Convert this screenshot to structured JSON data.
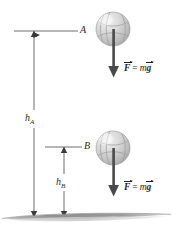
{
  "figure": {
    "background_color": "#ffffff",
    "ink_color": "#2b2b2b",
    "ball_color": "#c9c9c9",
    "ground_color": "#9a9a9a"
  },
  "points": [
    {
      "id": "A",
      "label": "A",
      "x": 82,
      "y": 31
    },
    {
      "id": "B",
      "label": "B",
      "x": 86,
      "y": 147
    }
  ],
  "heights": [
    {
      "id": "hA",
      "symbol": "h",
      "subscript": "A",
      "label": "h_A",
      "x": 27,
      "y": 118
    },
    {
      "id": "hB",
      "symbol": "h",
      "subscript": "B",
      "label": "h_B",
      "x": 57,
      "y": 182
    }
  ],
  "balls": [
    {
      "id": "ball-A",
      "cx": 113,
      "cy": 29,
      "r": 17
    },
    {
      "id": "ball-B",
      "cx": 113,
      "cy": 148,
      "r": 17
    }
  ],
  "force_vectors": [
    {
      "id": "force-A",
      "vector_symbol": "F",
      "equals": "=",
      "mass_symbol": "m",
      "gravity_symbol": "g",
      "text": "F = mg",
      "arrow_x": 114,
      "arrow_top": 30,
      "arrow_bottom": 76,
      "label_x": 124,
      "label_y": 68
    },
    {
      "id": "force-B",
      "vector_symbol": "F",
      "equals": "=",
      "mass_symbol": "m",
      "gravity_symbol": "g",
      "text": "F = mg",
      "arrow_x": 114,
      "arrow_top": 149,
      "arrow_bottom": 195,
      "label_x": 124,
      "label_y": 187
    }
  ],
  "ground": {
    "label": "ground-line",
    "y": 216
  }
}
